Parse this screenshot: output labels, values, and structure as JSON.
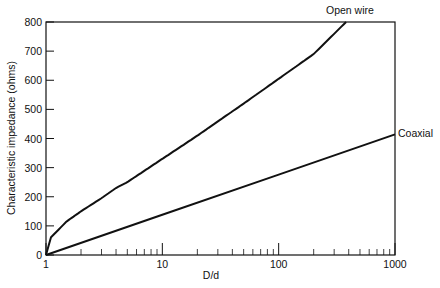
{
  "chart_data": {
    "type": "line",
    "title": "",
    "xlabel": "D/d",
    "ylabel": "Characteristic impedance (ohms)",
    "xscale": "log",
    "xlim": [
      1,
      1000
    ],
    "ylim": [
      0,
      800
    ],
    "x_ticks": [
      "1",
      "10",
      "100",
      "1000"
    ],
    "y_ticks": [
      "0",
      "100",
      "200",
      "300",
      "400",
      "500",
      "600",
      "700",
      "800"
    ],
    "grid": false,
    "legend": "inline labels at line ends",
    "series": [
      {
        "name": "Open wire",
        "x": [
          1,
          1.1,
          1.5,
          2,
          3,
          4,
          5,
          10,
          20,
          50,
          100,
          200,
          380
        ],
        "y": [
          0,
          60,
          115,
          150,
          195,
          230,
          250,
          330,
          410,
          520,
          605,
          690,
          800
        ]
      },
      {
        "name": "Coaxial",
        "x": [
          1,
          10,
          100,
          1000
        ],
        "y": [
          0,
          138,
          276,
          414
        ]
      }
    ]
  }
}
